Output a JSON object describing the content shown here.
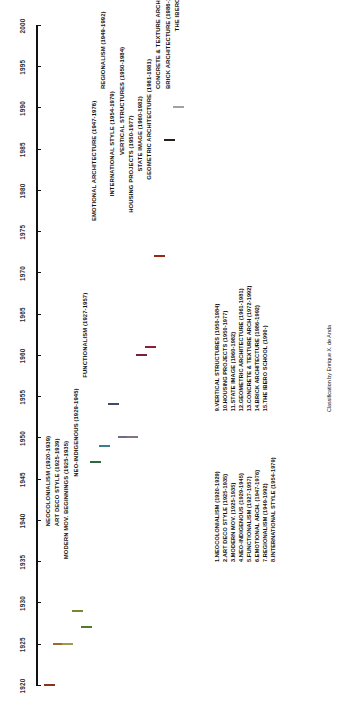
{
  "chart_data": {
    "type": "bar",
    "orientation": "horizontal-timeline",
    "title": "",
    "xlabel": "",
    "ylabel": "",
    "xlim": [
      1920,
      2000
    ],
    "grid": false,
    "legend_position": "bottom",
    "axis": {
      "ticks": [
        1920,
        1925,
        1930,
        1935,
        1940,
        1945,
        1950,
        1955,
        1960,
        1965,
        1970,
        1975,
        1980,
        1985,
        1990,
        1995,
        2000
      ]
    },
    "categories": [
      "NEOCOLONIALISM",
      "ART DECO STYLE",
      "MODERN MOV. BEGINNINGS",
      "NEO-INDIGENOUS",
      "FUNCTIONALISM",
      "EMOTIONAL ARCHITECTURE",
      "REGIONALISM",
      "INTERNATIONAL STYLE",
      "VERTICAL STRUCTURES",
      "HOUSING PROJECTS",
      "STATE IMAGE",
      "GEOMETRIC ARCHITECTURE",
      "CONCRETE & TEXTURE ARCH",
      "BRICK ARCHITECTURE",
      "THE IBERO SCHOOL"
    ],
    "bars": [
      {
        "n": 1,
        "label": "NEOCOLONIALISM (1920-1939)",
        "start": 1920,
        "end": 1939,
        "color": "#d1522a"
      },
      {
        "n": 2,
        "label": "ART DECO STYLE (1925-1939)",
        "start": 1925,
        "end": 1939,
        "color": "#f0a24a"
      },
      {
        "n": 3,
        "label": "MODERN MOV. BEGINNINGS (1925-1935)",
        "start": 1925,
        "end": 1935,
        "color": "#f4f07a"
      },
      {
        "n": 4,
        "label": "NEO-INDIGENOUS (1929-1945)",
        "start": 1929,
        "end": 1945,
        "color": "#b9d24a"
      },
      {
        "n": 5,
        "label": "FUNCTIONALISM (1927-1957)",
        "start": 1927,
        "end": 1957,
        "color": "#7ebf45"
      },
      {
        "n": 6,
        "label": "EMOTIONAL ARCHITECTURE (1947-1976)",
        "start": 1947,
        "end": 1976,
        "color": "#4a9e5e"
      },
      {
        "n": 7,
        "label": "REGIONALISM (1949-1992)",
        "start": 1949,
        "end": 1992,
        "color": "#5fc0d8"
      },
      {
        "n": 8,
        "label": "INTERNATIONAL STYLE (1954-1979)",
        "start": 1954,
        "end": 1979,
        "color": "#5d72a8"
      },
      {
        "n": 9,
        "label": "VERTICAL STRUCTURES (1950-1984)",
        "start": 1950,
        "end": 1984,
        "color": "#a8a6cc"
      },
      {
        "n": 10,
        "label": "HOUSING PROJECTS (1950-1977)",
        "start": 1950,
        "end": 1977,
        "color": "#ccafc8"
      },
      {
        "n": 11,
        "label": "STATE IMAGE (1960-1982)",
        "start": 1960,
        "end": 1982,
        "color": "#b8325c"
      },
      {
        "n": 12,
        "label": "GEOMETRIC ARCHITECTURE (1961-1981)",
        "start": 1961,
        "end": 1981,
        "color": "#d92f54"
      },
      {
        "n": 13,
        "label": "CONCRETE & TEXTURE ARCH (1972-1992)",
        "start": 1972,
        "end": 1992,
        "color": "#e8401c"
      },
      {
        "n": 14,
        "label": "BRICK ARCHITECTURE (1986-1992)",
        "start": 1986,
        "end": 1992,
        "color": "#3b322c"
      },
      {
        "n": 15,
        "label": "THE IBERO SCHOOL (1990-)",
        "start": 1990,
        "end": 1999,
        "color": "#f7f7f7"
      }
    ]
  },
  "legend": {
    "column_left": [
      "1.NEOCOLONIALISM (1920-1929)",
      "2.ART DECO STYLE (1925-1935)",
      "3.MODERN MOV. (1925-1935)",
      "4.NEO-INDIGENOUS (1929-1945)",
      "5.FUNCTIONALISM (1927-1957)",
      "6.EMOTIONAL ARCH. (1947-1976)",
      "7.REGIONALISM (1949-1992)",
      "8.INTERNATIONAL STYLE (1954-1979)"
    ],
    "column_right": [
      "9.VERTICAL STRUCTURES (1950-1984)",
      "10.HOUSING PROJECTS (1950-1977)",
      "11.STATE IMAGE (1960-1982)",
      "12.GEOMETRIC ARCHITECTURE (1961-1981)",
      "13.CONCRETE & TEXTURE ARCH (1972-1992)",
      "14.BRICK ARCHITECTURE (1986-1992)",
      "15.THE IBERO SCHOOL (1990-)"
    ]
  },
  "credit": "Classification by Enrique X. de Anda"
}
